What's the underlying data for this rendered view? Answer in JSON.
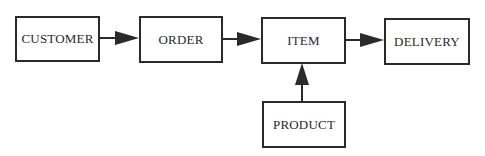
{
  "diagram": {
    "type": "flowchart",
    "colors": {
      "stroke": "#2a2a2a",
      "background": "#ffffff",
      "text": "#2a2a2a"
    },
    "nodes": [
      {
        "id": "customer",
        "label": "CUSTOMER"
      },
      {
        "id": "order",
        "label": "ORDER"
      },
      {
        "id": "item",
        "label": "ITEM"
      },
      {
        "id": "delivery",
        "label": "DELIVERY"
      },
      {
        "id": "product",
        "label": "PRODUCT"
      }
    ],
    "edges": [
      {
        "from": "customer",
        "to": "order"
      },
      {
        "from": "order",
        "to": "item"
      },
      {
        "from": "item",
        "to": "delivery"
      },
      {
        "from": "product",
        "to": "item"
      }
    ]
  }
}
